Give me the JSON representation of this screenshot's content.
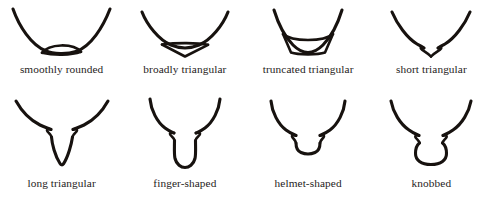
{
  "plate": {
    "title": "Shape terminology plate",
    "background_color": "#ffffff",
    "ink_color": "#17120f",
    "columns": 4,
    "rows": 2
  },
  "figures": [
    {
      "index": 1,
      "row": "top",
      "label": "smoothly rounded",
      "icon_name": "smoothly-rounded-shape",
      "description": "wide U outline with a low dome across the base"
    },
    {
      "index": 2,
      "row": "top",
      "label": "broadly triangular",
      "icon_name": "broadly-triangular-shape",
      "description": "wide V outline with a broad shallow triangle across the base"
    },
    {
      "index": 3,
      "row": "top",
      "label": "truncated triangular",
      "icon_name": "truncated-triangular-shape",
      "description": "narrow U outline with a flat-bottomed trapezoid at the base"
    },
    {
      "index": 4,
      "row": "top",
      "label": "short triangular",
      "icon_name": "short-triangular-shape",
      "description": "shallow V outline with a small notched point at the base"
    },
    {
      "index": 5,
      "row": "bottom",
      "label": "long triangular",
      "icon_name": "long-triangular-shape",
      "description": "raised wings with a long narrow tapering V descending from the centre"
    },
    {
      "index": 6,
      "row": "bottom",
      "label": "finger-shaped",
      "icon_name": "finger-shaped-shape",
      "description": "raised wings with a long parallel-sided lobe rounded at the tip"
    },
    {
      "index": 7,
      "row": "bottom",
      "label": "helmet-shaped",
      "icon_name": "helmet-shaped-shape",
      "description": "raised wings with a short broad rounded lobe at the centre"
    },
    {
      "index": 8,
      "row": "bottom",
      "label": "knobbed",
      "icon_name": "knobbed-shape",
      "description": "raised wings pinched to a neck above a bulbous rounded knob"
    }
  ]
}
